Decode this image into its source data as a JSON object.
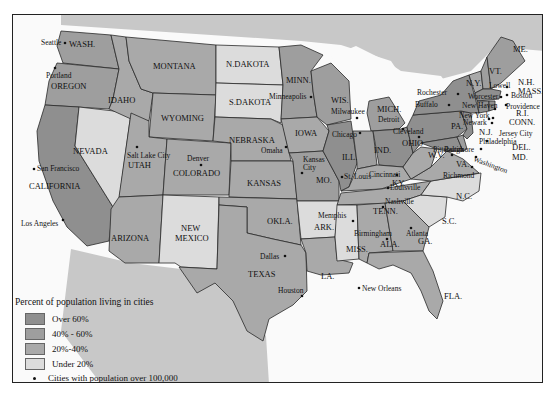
{
  "colors": {
    "over_60": "#8f8f8f",
    "40_60": "#9e9e9e",
    "20_40": "#a9a9a9",
    "under_20": "#dcdcdc",
    "canada_mexico": "#c8c8c8",
    "water": "#fafafa"
  },
  "legend": {
    "title": "Percent of population living in cities",
    "items": [
      {
        "label": "Over 60%",
        "category": "over_60"
      },
      {
        "label": "40% - 60%",
        "category": "40_60"
      },
      {
        "label": "20%-40%",
        "category": "20_40"
      },
      {
        "label": "Under 20%",
        "category": "under_20"
      }
    ],
    "cities_note": "Cities with population over 100,000"
  },
  "states": [
    {
      "label": "WASH.",
      "category": "40_60"
    },
    {
      "label": "OREGON",
      "category": "40_60"
    },
    {
      "label": "CALIFORNIA",
      "category": "over_60"
    },
    {
      "label": "NEVADA",
      "category": "under_20"
    },
    {
      "label": "IDAHO",
      "category": "20_40"
    },
    {
      "label": "MONTANA",
      "category": "20_40"
    },
    {
      "label": "WYOMING",
      "category": "20_40"
    },
    {
      "label": "UTAH",
      "category": "20_40"
    },
    {
      "label": "COLORADO",
      "category": "20_40"
    },
    {
      "label": "ARIZONA",
      "category": "20_40"
    },
    {
      "label": "NEW MEXICO",
      "category": "under_20"
    },
    {
      "label": "N.DAKOTA",
      "category": "under_20"
    },
    {
      "label": "S.DAKOTA",
      "category": "under_20"
    },
    {
      "label": "NEBRASKA",
      "category": "20_40"
    },
    {
      "label": "KANSAS",
      "category": "20_40"
    },
    {
      "label": "OKLA.",
      "category": "20_40"
    },
    {
      "label": "TEXAS",
      "category": "20_40"
    },
    {
      "label": "MINN.",
      "category": "40_60"
    },
    {
      "label": "IOWA",
      "category": "20_40"
    },
    {
      "label": "MO.",
      "category": "40_60"
    },
    {
      "label": "ARK.",
      "category": "under_20"
    },
    {
      "label": "LA.",
      "category": "20_40"
    },
    {
      "label": "WIS.",
      "category": "40_60"
    },
    {
      "label": "ILL.",
      "category": "over_60"
    },
    {
      "label": "MICH.",
      "category": "40_60"
    },
    {
      "label": "IND.",
      "category": "40_60"
    },
    {
      "label": "OHIO",
      "category": "over_60"
    },
    {
      "label": "KY.",
      "category": "20_40"
    },
    {
      "label": "TENN.",
      "category": "20_40"
    },
    {
      "label": "MISS.",
      "category": "under_20"
    },
    {
      "label": "ALA.",
      "category": "20_40"
    },
    {
      "label": "GA.",
      "category": "20_40"
    },
    {
      "label": "FLA.",
      "category": "20_40"
    },
    {
      "label": "N.C.",
      "category": "under_20"
    },
    {
      "label": "S.C.",
      "category": "under_20"
    },
    {
      "label": "VA.",
      "category": "20_40"
    },
    {
      "label": "W.V.",
      "category": "20_40"
    },
    {
      "label": "PA.",
      "category": "over_60"
    },
    {
      "label": "N.Y.",
      "category": "over_60"
    },
    {
      "label": "N.J.",
      "category": "over_60"
    },
    {
      "label": "DEL.",
      "category": "40_60"
    },
    {
      "label": "MD.",
      "category": "over_60"
    },
    {
      "label": "VT.",
      "category": "20_40"
    },
    {
      "label": "N.H.",
      "category": "40_60"
    },
    {
      "label": "ME.",
      "category": "40_60"
    },
    {
      "label": "MASS.",
      "category": "over_60"
    },
    {
      "label": "R.I.",
      "category": "over_60"
    },
    {
      "label": "CONN.",
      "category": "over_60"
    }
  ],
  "cities": [
    "Seattle",
    "Portland",
    "San Francisco",
    "Los Angeles",
    "Salt Lake City",
    "Denver",
    "Omaha",
    "Kansas City",
    "Dallas",
    "Houston",
    "Minneapolis",
    "Milwaukee",
    "Chicago",
    "St. Louis",
    "Memphis",
    "New Orleans",
    "Detroit",
    "Cleveland",
    "Cincinnati",
    "Louisville",
    "Nashville",
    "Birmingham",
    "Atlanta",
    "Pittsburgh",
    "Richmond",
    "Washington",
    "Baltimore",
    "Philadelphia",
    "Newark",
    "New York",
    "Jersey City",
    "Buffalo",
    "Rochester",
    "New Haven",
    "Providence",
    "Boston",
    "Worcester",
    "Lowell"
  ]
}
